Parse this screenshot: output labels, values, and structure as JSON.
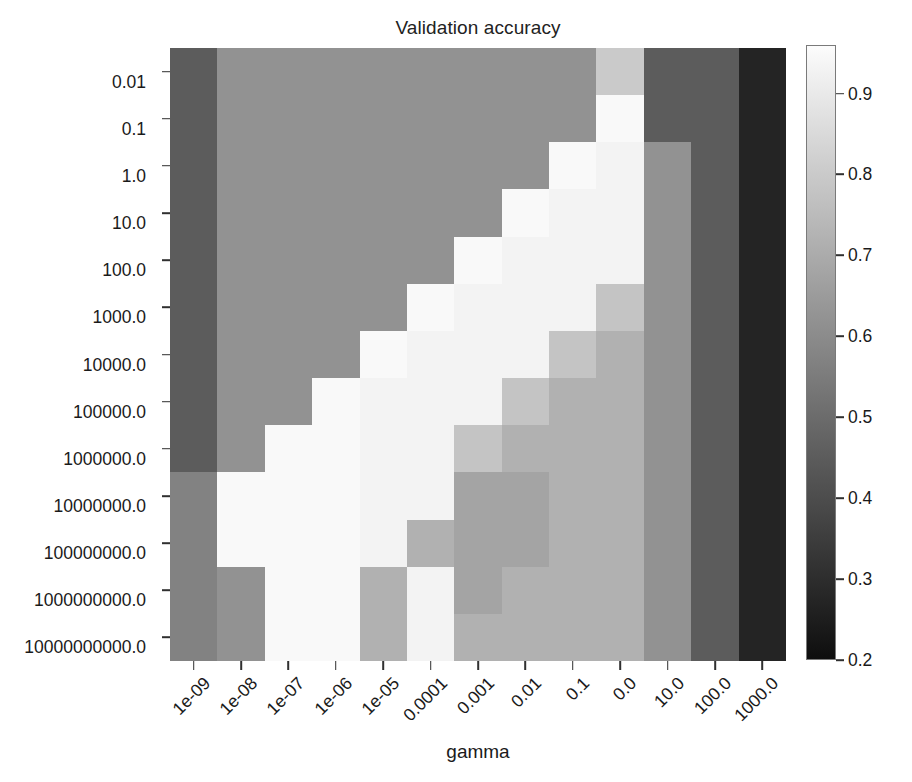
{
  "chart_data": {
    "type": "heatmap",
    "title": "Validation accuracy",
    "xlabel": "gamma",
    "ylabel": "",
    "grid": false,
    "legend_position": "right",
    "colormap": "grayscale",
    "colorbar": {
      "vmin": 0.2,
      "vmax": 0.96,
      "ticks": [
        0.9,
        0.8,
        0.7,
        0.6,
        0.5,
        0.4,
        0.3,
        0.2
      ],
      "tick_labels": [
        "0.9",
        "0.8",
        "0.7",
        "0.6",
        "0.5",
        "0.4",
        "0.3",
        "0.2"
      ]
    },
    "x_tick_labels": [
      "1e-09",
      "1e-08",
      "1e-07",
      "1e-06",
      "1e-05",
      "0.0001",
      "0.001",
      "0.01",
      "0.1",
      "0.0",
      "10.0",
      "100.0",
      "1000.0"
    ],
    "y_tick_labels": [
      "0.01",
      "0.1",
      "1.0",
      "10.0",
      "100.0",
      "1000.0",
      "10000.0",
      "100000.0",
      "1000000.0",
      "10000000.0",
      "100000000.0",
      "1000000000.0",
      "10000000000.0"
    ],
    "values": [
      [
        0.45,
        0.62,
        0.62,
        0.62,
        0.62,
        0.62,
        0.62,
        0.62,
        0.62,
        0.8,
        0.45,
        0.45,
        0.27
      ],
      [
        0.45,
        0.62,
        0.62,
        0.62,
        0.62,
        0.62,
        0.62,
        0.62,
        0.62,
        0.95,
        0.45,
        0.45,
        0.27
      ],
      [
        0.45,
        0.62,
        0.62,
        0.62,
        0.62,
        0.62,
        0.62,
        0.62,
        0.95,
        0.93,
        0.62,
        0.45,
        0.27
      ],
      [
        0.45,
        0.62,
        0.62,
        0.62,
        0.62,
        0.62,
        0.62,
        0.95,
        0.93,
        0.93,
        0.62,
        0.45,
        0.27
      ],
      [
        0.45,
        0.62,
        0.62,
        0.62,
        0.62,
        0.62,
        0.95,
        0.93,
        0.93,
        0.93,
        0.62,
        0.45,
        0.27
      ],
      [
        0.45,
        0.62,
        0.62,
        0.62,
        0.62,
        0.95,
        0.93,
        0.93,
        0.93,
        0.78,
        0.62,
        0.45,
        0.27
      ],
      [
        0.45,
        0.62,
        0.62,
        0.62,
        0.95,
        0.93,
        0.93,
        0.93,
        0.78,
        0.72,
        0.62,
        0.45,
        0.27
      ],
      [
        0.45,
        0.62,
        0.62,
        0.95,
        0.93,
        0.93,
        0.93,
        0.78,
        0.72,
        0.72,
        0.62,
        0.45,
        0.27
      ],
      [
        0.45,
        0.62,
        0.95,
        0.95,
        0.93,
        0.93,
        0.78,
        0.72,
        0.72,
        0.72,
        0.62,
        0.45,
        0.27
      ],
      [
        0.57,
        0.95,
        0.95,
        0.95,
        0.93,
        0.93,
        0.68,
        0.68,
        0.72,
        0.72,
        0.62,
        0.45,
        0.27
      ],
      [
        0.57,
        0.95,
        0.95,
        0.95,
        0.93,
        0.72,
        0.68,
        0.68,
        0.72,
        0.72,
        0.62,
        0.45,
        0.27
      ],
      [
        0.57,
        0.62,
        0.95,
        0.95,
        0.72,
        0.93,
        0.68,
        0.72,
        0.72,
        0.72,
        0.62,
        0.45,
        0.27
      ],
      [
        0.57,
        0.62,
        0.95,
        0.95,
        0.72,
        0.93,
        0.72,
        0.72,
        0.72,
        0.72,
        0.62,
        0.45,
        0.27
      ]
    ]
  }
}
